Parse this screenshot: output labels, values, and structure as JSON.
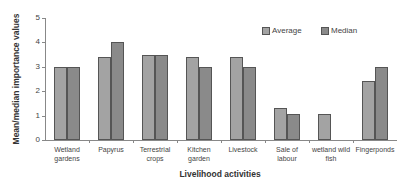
{
  "chart_data": {
    "type": "bar",
    "title": "",
    "xlabel": "Livelihood activities",
    "ylabel": "Mean/median importance values",
    "ylim": [
      0,
      5
    ],
    "yticks": [
      "0",
      "1",
      "2",
      "3",
      "4",
      "5"
    ],
    "grid": false,
    "legend_position": "top-right",
    "categories": [
      "Wetland gardens",
      "Papyrus",
      "Terrestrial crops",
      "Kitchen garden",
      "Livestock",
      "Sale of labour",
      "wetland wild fish",
      "Fingerponds"
    ],
    "series": [
      {
        "name": "Average",
        "color": "#a3a3a3",
        "values": [
          3.0,
          3.4,
          3.5,
          3.4,
          3.4,
          1.3,
          1.05,
          2.4
        ]
      },
      {
        "name": "Median",
        "color": "#8a8a8a",
        "values": [
          3.0,
          4.0,
          3.5,
          3.0,
          3.0,
          1.05,
          0,
          3.0
        ]
      }
    ]
  },
  "labels": {
    "ylabel": "Mean/median importance values",
    "xlabel": "Livelihood activities",
    "legend_average": "Average",
    "legend_median": "Median",
    "y0": "0",
    "y1": "1",
    "y2": "2",
    "y3": "3",
    "y4": "4",
    "y5": "5",
    "cat0_l1": "Wetland",
    "cat0_l2": "gardens",
    "cat1_l1": "Papyrus",
    "cat1_l2": "",
    "cat2_l1": "Terrestrial",
    "cat2_l2": "crops",
    "cat3_l1": "Kitchen",
    "cat3_l2": "garden",
    "cat4_l1": "Livestock",
    "cat4_l2": "",
    "cat5_l1": "Sale of",
    "cat5_l2": "labour",
    "cat6_l1": "wetland wild",
    "cat6_l2": "fish",
    "cat7_l1": "Fingerponds",
    "cat7_l2": ""
  }
}
